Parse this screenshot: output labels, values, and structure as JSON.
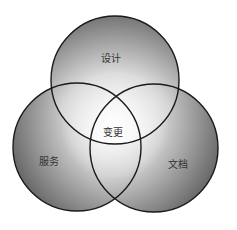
{
  "diagram": {
    "type": "venn-3",
    "sets": [
      {
        "id": "design",
        "label": "设计",
        "cx": 115,
        "cy": 80,
        "r": 64
      },
      {
        "id": "service",
        "label": "服务",
        "cx": 77,
        "cy": 147,
        "r": 64
      },
      {
        "id": "document",
        "label": "文档",
        "cx": 154,
        "cy": 148,
        "r": 64
      }
    ],
    "center_label": "变更",
    "label_positions": {
      "design": {
        "x": 111,
        "y": 57
      },
      "service": {
        "x": 49,
        "y": 160
      },
      "document": {
        "x": 178,
        "y": 163
      },
      "center": {
        "x": 113,
        "y": 131
      }
    },
    "colors": {
      "stroke": "#1a1a1a",
      "shade_dark": "#6e6e6e",
      "shade_light": "#f4f4f4",
      "text": "#333333"
    }
  }
}
